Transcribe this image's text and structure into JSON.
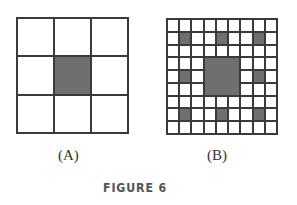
{
  "figure": {
    "caption": "FIGURE 6",
    "panels": [
      {
        "label": "(A)",
        "grid_size": 3,
        "filled_cells": [
          [
            1,
            1
          ]
        ]
      },
      {
        "label": "(B)",
        "grid_size": 9,
        "filled_cells": [
          [
            1,
            1
          ],
          [
            1,
            4
          ],
          [
            1,
            7
          ],
          [
            4,
            1
          ],
          [
            4,
            7
          ],
          [
            7,
            1
          ],
          [
            7,
            4
          ],
          [
            7,
            7
          ]
        ],
        "filled_blocks": [
          {
            "row": 3,
            "col": 3,
            "size": 3
          }
        ]
      }
    ],
    "colors": {
      "line": "#3a3a3a",
      "fill": "#6f6f6f",
      "background": "#ffffff"
    }
  }
}
